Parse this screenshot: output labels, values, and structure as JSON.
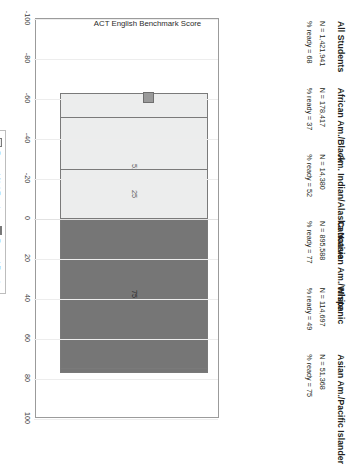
{
  "chart_data": {
    "type": "bar",
    "title": "",
    "xlabel": "",
    "ylabel": "ACT English Benchmark Score",
    "ylim": [
      -100,
      100
    ],
    "grid": true,
    "legend_position": "bottom",
    "orientation": "vertical-diverging",
    "categories": [
      "All Students",
      "African Am./Black",
      "Am. Indian/Alaska Native",
      "Caucasian Am./White",
      "Hispanic",
      "Asian Am./Pacific Islander"
    ],
    "tick_labels": [
      "-100",
      "-80",
      "-60",
      "-40",
      "-20",
      "0",
      "20",
      "40",
      "60",
      "80",
      "100"
    ],
    "tick_values": [
      -100,
      -80,
      -60,
      -40,
      -20,
      0,
      20,
      40,
      60,
      80,
      100
    ],
    "series": [
      {
        "name": "Percent Ready",
        "values": [
          68,
          37,
          52,
          77,
          49,
          75
        ]
      },
      {
        "name": "Percent Not Ready",
        "values": [
          32,
          63,
          48,
          23,
          51,
          25
        ]
      }
    ],
    "annotations": [
      {
        "category": "All Students",
        "n_label": "N = 1,421,941",
        "ready_label": "% ready =  68",
        "n": "1,421,941",
        "ready": 68
      },
      {
        "category": "African Am./Black",
        "n_label": "N =  178,417",
        "ready_label": "% ready = 37",
        "n": "178,417",
        "ready": 37
      },
      {
        "category": "Am. Indian/Alaska Native",
        "n_label": "N =  14,380",
        "ready_label": "% ready = 52",
        "n": "14,380",
        "ready": 52
      },
      {
        "category": "Caucasian Am./White",
        "n_label": "N =  895,588",
        "ready_label": "% ready = 77",
        "n": "895,588",
        "ready": 77
      },
      {
        "category": "Hispanic",
        "n_label": "N =  114,697",
        "ready_label": "% ready = 49",
        "n": "114,697",
        "ready": 49
      },
      {
        "category": "Asian Am./Pacific Islander",
        "n_label": "N =  51,368",
        "ready_label": "% ready = 75",
        "n": "51,368",
        "ready": 75
      }
    ],
    "colors": {
      "ready": "#767676",
      "not_ready": "#eceded",
      "frame": "#9b9b9b",
      "grid": "#ededed"
    }
  },
  "legend": {
    "items": [
      {
        "label": "Percent Not Ready",
        "key": "not"
      },
      {
        "label": "Percent Ready",
        "key": "ready"
      }
    ]
  },
  "axis": {
    "title": "ACT English Benchmark Score"
  }
}
